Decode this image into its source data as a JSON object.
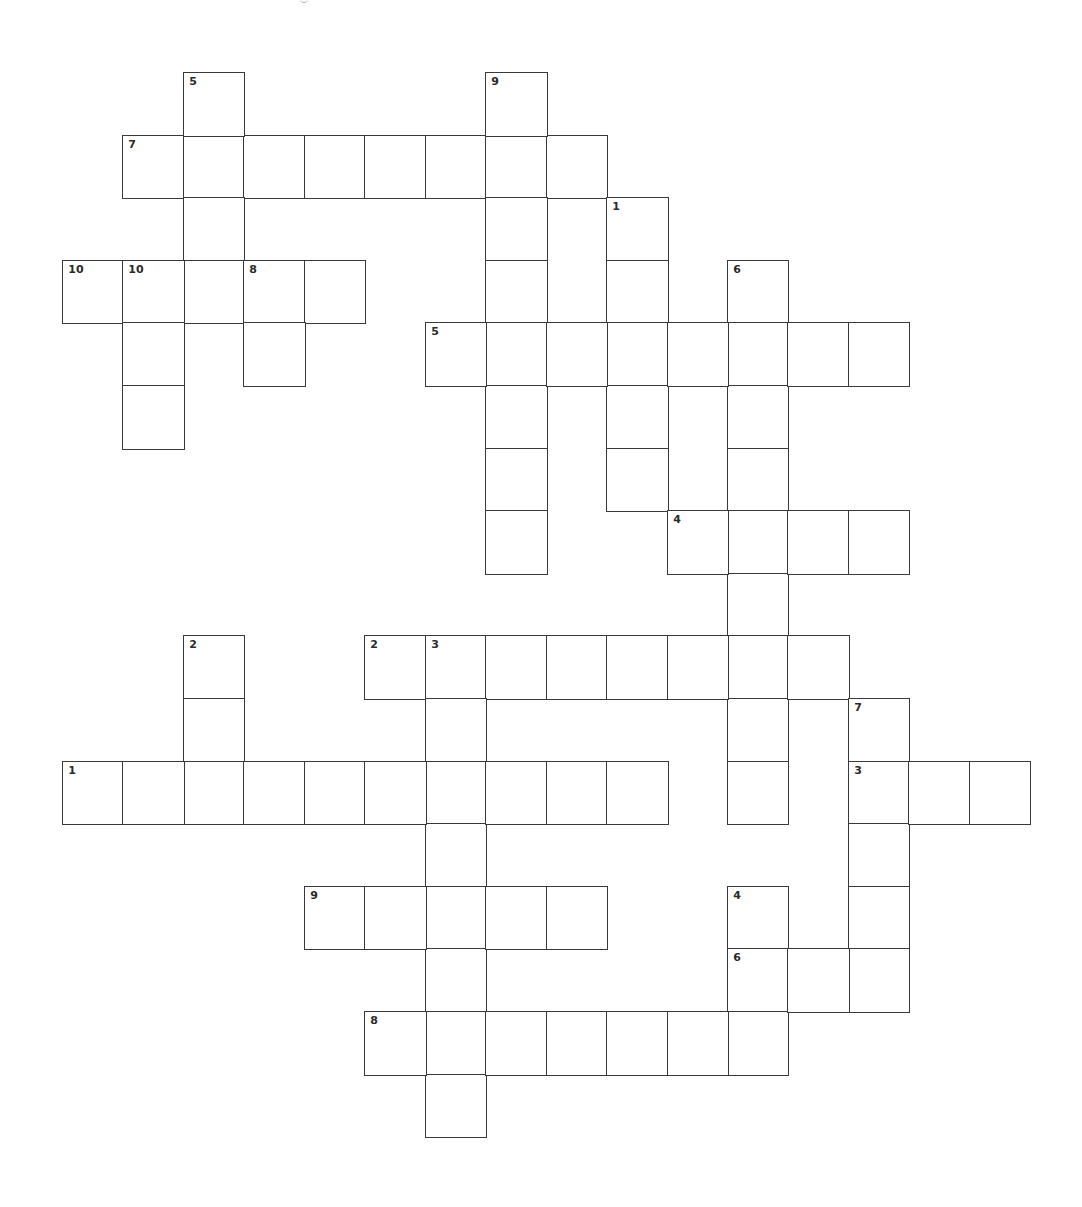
{
  "puzzle": {
    "type": "crossword",
    "grid": {
      "origin_x": 63,
      "origin_y": 73,
      "cell_width": 60.45,
      "cell_height": 62.6,
      "cols": 16,
      "rows": 17,
      "border_color": "#3a3a3a",
      "background": "#ffffff"
    },
    "entries": [
      {
        "number": "7",
        "direction": "across",
        "row": 1,
        "col": 1,
        "length": 8
      },
      {
        "number": "5",
        "direction": "down",
        "row": 0,
        "col": 2,
        "length": 4
      },
      {
        "number": "9",
        "direction": "down",
        "row": 0,
        "col": 7,
        "length": 8
      },
      {
        "number": "1",
        "direction": "down",
        "row": 2,
        "col": 9,
        "length": 5
      },
      {
        "number": "10",
        "direction": "across",
        "row": 3,
        "col": 0,
        "length": 5
      },
      {
        "number": "10",
        "direction": "down",
        "row": 3,
        "col": 1,
        "length": 3
      },
      {
        "number": "8",
        "direction": "down",
        "row": 3,
        "col": 3,
        "length": 2
      },
      {
        "number": "6",
        "direction": "down",
        "row": 3,
        "col": 11,
        "length": 9
      },
      {
        "number": "5",
        "direction": "across",
        "row": 4,
        "col": 6,
        "length": 8
      },
      {
        "number": "4",
        "direction": "across",
        "row": 7,
        "col": 10,
        "length": 4
      },
      {
        "number": "2",
        "direction": "down",
        "row": 9,
        "col": 2,
        "length": 3
      },
      {
        "number": "2",
        "direction": "across",
        "row": 9,
        "col": 5,
        "length": 8
      },
      {
        "number": "3",
        "direction": "down",
        "row": 9,
        "col": 6,
        "length": 8
      },
      {
        "number": "7",
        "direction": "down",
        "row": 10,
        "col": 13,
        "length": 5
      },
      {
        "number": "1",
        "direction": "across",
        "row": 11,
        "col": 0,
        "length": 10
      },
      {
        "number": "3",
        "direction": "across",
        "row": 11,
        "col": 13,
        "length": 3
      },
      {
        "number": "9",
        "direction": "across",
        "row": 13,
        "col": 4,
        "length": 5
      },
      {
        "number": "4",
        "direction": "down",
        "row": 13,
        "col": 11,
        "length": 3
      },
      {
        "number": "6",
        "direction": "across",
        "row": 14,
        "col": 11,
        "length": 3
      },
      {
        "number": "8",
        "direction": "across",
        "row": 15,
        "col": 5,
        "length": 7
      }
    ]
  }
}
